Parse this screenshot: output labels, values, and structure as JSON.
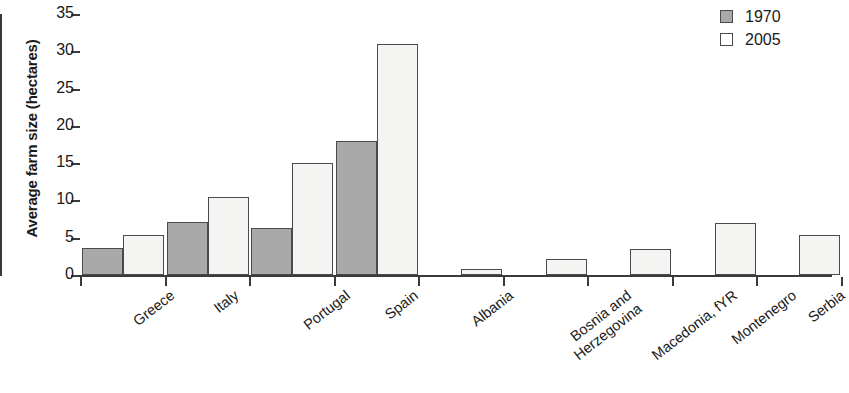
{
  "chart_data": {
    "type": "bar",
    "title": "",
    "subtitle": "",
    "xlabel": "",
    "ylabel": "Average farm size (hectares)",
    "ylim": [
      0,
      35
    ],
    "ytick_values": [
      0,
      5,
      10,
      15,
      20,
      25,
      30,
      35
    ],
    "ytick_labels": [
      "0",
      "5",
      "10",
      "15",
      "20",
      "25",
      "30",
      "35"
    ],
    "grid": false,
    "legend_position": "top-right",
    "categories": [
      "Greece",
      "Italy",
      "Portugal",
      "Spain",
      "Albania",
      "Bosnia and Herzegovina",
      "Macedonia, fYR",
      "Montenegro",
      "Serbia"
    ],
    "series": [
      {
        "name": "1970",
        "color": "#a9a9a9",
        "values": [
          3.6,
          7.1,
          6.3,
          18.0,
          null,
          null,
          null,
          null,
          null
        ]
      },
      {
        "name": "2005",
        "color": "#f4f4f2",
        "values": [
          5.3,
          10.5,
          15.0,
          31.0,
          0.8,
          2.1,
          3.5,
          7.0,
          5.4
        ]
      }
    ]
  },
  "legend": {
    "entries": [
      {
        "label": "1970",
        "swatch": "filled-gray-square"
      },
      {
        "label": "2005",
        "swatch": "empty-white-square"
      }
    ]
  },
  "axis": {
    "y_title": "Average farm size (hectares)"
  },
  "x_labels": [
    {
      "line1": "Greece",
      "line2": ""
    },
    {
      "line1": "Italy",
      "line2": ""
    },
    {
      "line1": "Portugal",
      "line2": ""
    },
    {
      "line1": "Spain",
      "line2": ""
    },
    {
      "line1": "Albania",
      "line2": ""
    },
    {
      "line1": "Bosnia and",
      "line2": "Herzegovina"
    },
    {
      "line1": "Macedonia, fYR",
      "line2": ""
    },
    {
      "line1": "Montenegro",
      "line2": ""
    },
    {
      "line1": "Serbia",
      "line2": ""
    }
  ]
}
